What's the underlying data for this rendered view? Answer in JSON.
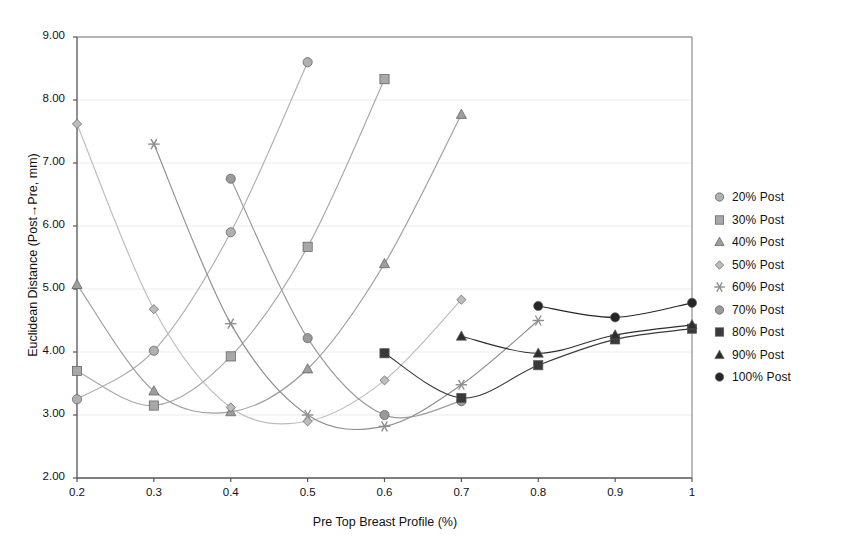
{
  "chart_data": {
    "type": "scatter",
    "title": "",
    "xlabel": "Pre Top Breast Profile (%)",
    "ylabel": "Euclidean Distance (Post→Pre, mm)",
    "xlim": [
      0.2,
      1.0
    ],
    "ylim": [
      2.0,
      9.0
    ],
    "xticks": [
      "0.2",
      "0.3",
      "0.4",
      "0.5",
      "0.6",
      "0.7",
      "0.8",
      "0.9",
      "1"
    ],
    "yticks": [
      "2.00",
      "3.00",
      "4.00",
      "5.00",
      "6.00",
      "7.00",
      "8.00",
      "9.00"
    ],
    "grid": "horizontal-faint",
    "legend_position": "right",
    "series": [
      {
        "name": "20% Post",
        "marker": "circle",
        "color": "#b0b0b0",
        "x": [
          0.2,
          0.3,
          0.4,
          0.5
        ],
        "values": [
          3.25,
          4.02,
          5.9,
          8.6
        ]
      },
      {
        "name": "30% Post",
        "marker": "square",
        "color": "#a8a8a8",
        "x": [
          0.2,
          0.3,
          0.4,
          0.5,
          0.6
        ],
        "values": [
          3.7,
          3.15,
          3.93,
          5.67,
          8.33
        ]
      },
      {
        "name": "40% Post",
        "marker": "triangle",
        "color": "#9e9e9e",
        "x": [
          0.2,
          0.3,
          0.4,
          0.5,
          0.6,
          0.7
        ],
        "values": [
          5.07,
          3.38,
          3.05,
          3.73,
          5.4,
          7.77
        ]
      },
      {
        "name": "50% Post",
        "marker": "diamond",
        "color": "#bdbdbd",
        "x": [
          0.2,
          0.3,
          0.4,
          0.5,
          0.6,
          0.7
        ],
        "values": [
          7.62,
          4.68,
          3.12,
          2.9,
          3.55,
          4.83
        ]
      },
      {
        "name": "60% Post",
        "marker": "star",
        "color": "#8d8d8d",
        "x": [
          0.3,
          0.4,
          0.5,
          0.6,
          0.7,
          0.8
        ],
        "values": [
          7.3,
          4.45,
          3.0,
          2.82,
          3.48,
          4.5
        ]
      },
      {
        "name": "70% Post",
        "marker": "circle",
        "color": "#9a9a9a",
        "x": [
          0.4,
          0.5,
          0.6,
          0.7
        ],
        "values": [
          6.75,
          4.22,
          3.0,
          3.22
        ]
      },
      {
        "name": "80% Post",
        "marker": "square",
        "color": "#3a3a3a",
        "x": [
          0.6,
          0.7,
          0.8,
          0.9,
          1.0
        ],
        "values": [
          3.98,
          3.27,
          3.79,
          4.2,
          4.37
        ]
      },
      {
        "name": "90% Post",
        "marker": "triangle",
        "color": "#2e2e2e",
        "x": [
          0.7,
          0.8,
          0.9,
          1.0
        ],
        "values": [
          4.25,
          3.98,
          4.27,
          4.43
        ]
      },
      {
        "name": "100% Post",
        "marker": "circle",
        "color": "#262626",
        "x": [
          0.8,
          0.9,
          1.0
        ],
        "values": [
          4.73,
          4.55,
          4.78
        ]
      }
    ]
  }
}
